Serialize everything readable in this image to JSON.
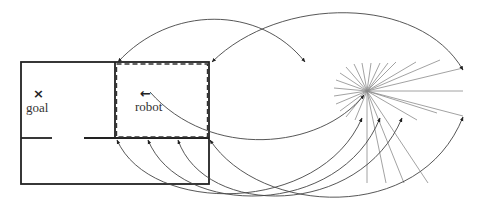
{
  "figure": {
    "labels": {
      "goal": "goal",
      "robot": "robot"
    },
    "markers": {
      "goal_marker": "×",
      "robot_heading": "←"
    },
    "colors": {
      "wall": "#222222",
      "dashed_region": "#333333",
      "arc": "#444444",
      "ray": "#8a8a8a",
      "background": "#ffffff"
    },
    "description_elements": [
      "floor-plan with two rooms and a lower corridor",
      "goal room (left) with goal marker",
      "robot room (right) outlined with dashed border, robot heading left",
      "sensor ray fan centered to the right",
      "curved two-way arcs mapping room boundary points to ray endpoints"
    ]
  }
}
